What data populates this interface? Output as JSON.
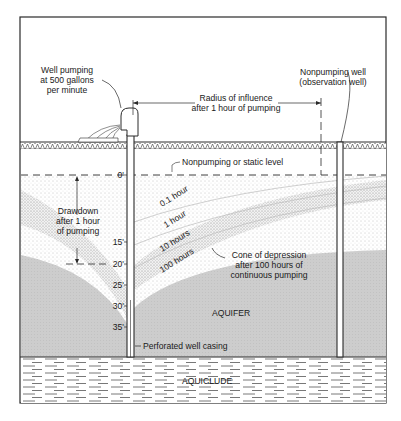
{
  "diagram": {
    "labels": {
      "pumping_well_line1": "Well pumping",
      "pumping_well_line2": "at 500 gallons",
      "pumping_well_line3": "per minute",
      "radius_line1": "Radius of influence",
      "radius_line2": "after 1 hour of pumping",
      "observation_line1": "Nonpumping well",
      "observation_line2": "(observation well)",
      "static_level": "Nonpumping or static level",
      "drawdown_line1": "Drawdown",
      "drawdown_line2": "after 1 hour",
      "drawdown_line3": "of pumping",
      "cone_line1": "Cone of depression",
      "cone_line2": "after 100 hours of",
      "cone_line3": "continuous pumping",
      "aquifer": "AQUIFER",
      "aquiclude": "AQUICLUDE",
      "casing": "Perforated well casing"
    },
    "time_curves": [
      "0.1 hour",
      "1 hour",
      "10 hours",
      "100 hours"
    ],
    "depth_ticks": [
      "0'",
      "15'",
      "20'",
      "25'",
      "30'",
      "35'"
    ],
    "colors": {
      "line": "#2a2a2a",
      "aquifer_fill": "#cfcfcf",
      "stipple": "#9a9a9a",
      "background": "#ffffff"
    }
  }
}
